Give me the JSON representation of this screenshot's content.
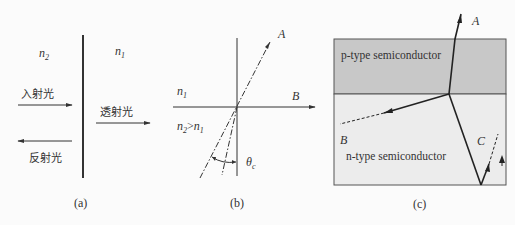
{
  "figure": {
    "panels": [
      {
        "id": "a",
        "caption": "(a)",
        "medium_left": {
          "label": "n",
          "sub": "2"
        },
        "medium_right": {
          "label": "n",
          "sub": "1"
        },
        "rays": {
          "incident": "入射光",
          "transmitted": "透射光",
          "reflected": "反射光"
        }
      },
      {
        "id": "b",
        "caption": "(b)",
        "upper_medium": {
          "label": "n",
          "sub": "1"
        },
        "lower_medium": {
          "label": "n",
          "sub": "2",
          "relation": ">",
          "compare": "n",
          "compare_sub": "1"
        },
        "ray_labels": {
          "a": "A",
          "b": "B"
        },
        "angle": {
          "symbol": "θ",
          "sub": "c"
        }
      },
      {
        "id": "c",
        "caption": "(c)",
        "top_layer": "p-type semiconductor",
        "bottom_layer": "n-type semiconductor",
        "ray_labels": {
          "a": "A",
          "b": "B",
          "c": "C"
        },
        "colors": {
          "p_layer": "#c8c8c8",
          "n_layer": "#ececec",
          "border": "#555555"
        }
      }
    ]
  }
}
